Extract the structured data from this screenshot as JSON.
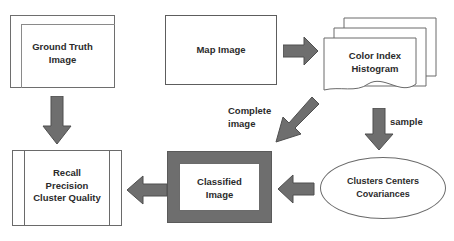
{
  "diagram": {
    "nodes": {
      "ground_truth": {
        "label": "Ground Truth\nImage",
        "shape": "layered-rectangle"
      },
      "map_image": {
        "label": "Map Image",
        "shape": "rectangle"
      },
      "histogram": {
        "label": "Color Index\nHistogram",
        "shape": "multiple-documents"
      },
      "classified": {
        "label": "Classified\nImage",
        "shape": "framed-rectangle"
      },
      "metrics": {
        "label": "Recall\nPrecision\nCluster Quality",
        "shape": "predefined-process"
      },
      "clusters": {
        "label": "Clusters Centers\nCovariances",
        "shape": "ellipse"
      }
    },
    "edges": {
      "ground_truth_to_metrics": {
        "label": "",
        "direction": "down"
      },
      "map_to_histogram": {
        "label": "",
        "direction": "right"
      },
      "histogram_to_clusters": {
        "label": "sample",
        "direction": "down"
      },
      "histogram_to_classified": {
        "label": "Complete\nimage",
        "direction": "down-left"
      },
      "clusters_to_classified": {
        "label": "",
        "direction": "left"
      },
      "classified_to_metrics": {
        "label": "",
        "direction": "left"
      }
    },
    "colors": {
      "arrow_fill": "#6e6e6e",
      "arrow_stroke": "#4f4f4f",
      "outline": "#6a6a6a",
      "text": "#2b2b2b",
      "background": "#ffffff"
    }
  }
}
